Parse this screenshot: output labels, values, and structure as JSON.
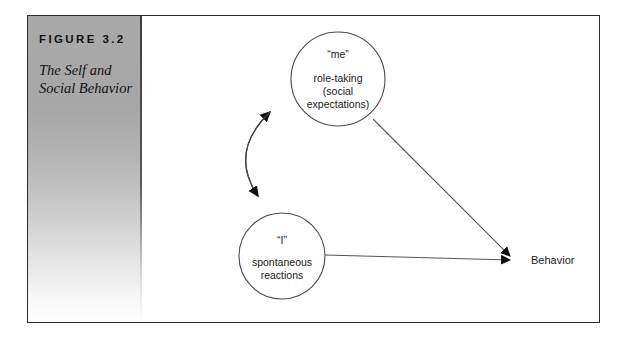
{
  "figure": {
    "label": "FIGURE 3.2",
    "caption_line1": "The Self and",
    "caption_line2": "Social Behavior"
  },
  "diagram": {
    "nodes": [
      {
        "id": "me",
        "title": "“me”",
        "line1": "role-taking",
        "line2": "(social",
        "line3": "expectations)"
      },
      {
        "id": "i",
        "title": "“I”",
        "line1": "spontaneous",
        "line2": "reactions",
        "line3": ""
      }
    ],
    "outcome_label": "Behavior",
    "connectors": [
      {
        "id": "me-i-bidirectional",
        "from": "me",
        "to": "i",
        "style": "curved",
        "arrows": "both"
      },
      {
        "id": "me-behavior",
        "from": "me",
        "to": "behavior",
        "style": "straight",
        "arrows": "end"
      },
      {
        "id": "i-behavior",
        "from": "i",
        "to": "behavior",
        "style": "straight",
        "arrows": "end"
      }
    ]
  },
  "colors": {
    "frame": "#2b2b2b",
    "panel_top": "#a9a9a9",
    "panel_bottom": "#ffffff",
    "ink": "#1a1a1a",
    "stroke": "#4a4a4a"
  }
}
